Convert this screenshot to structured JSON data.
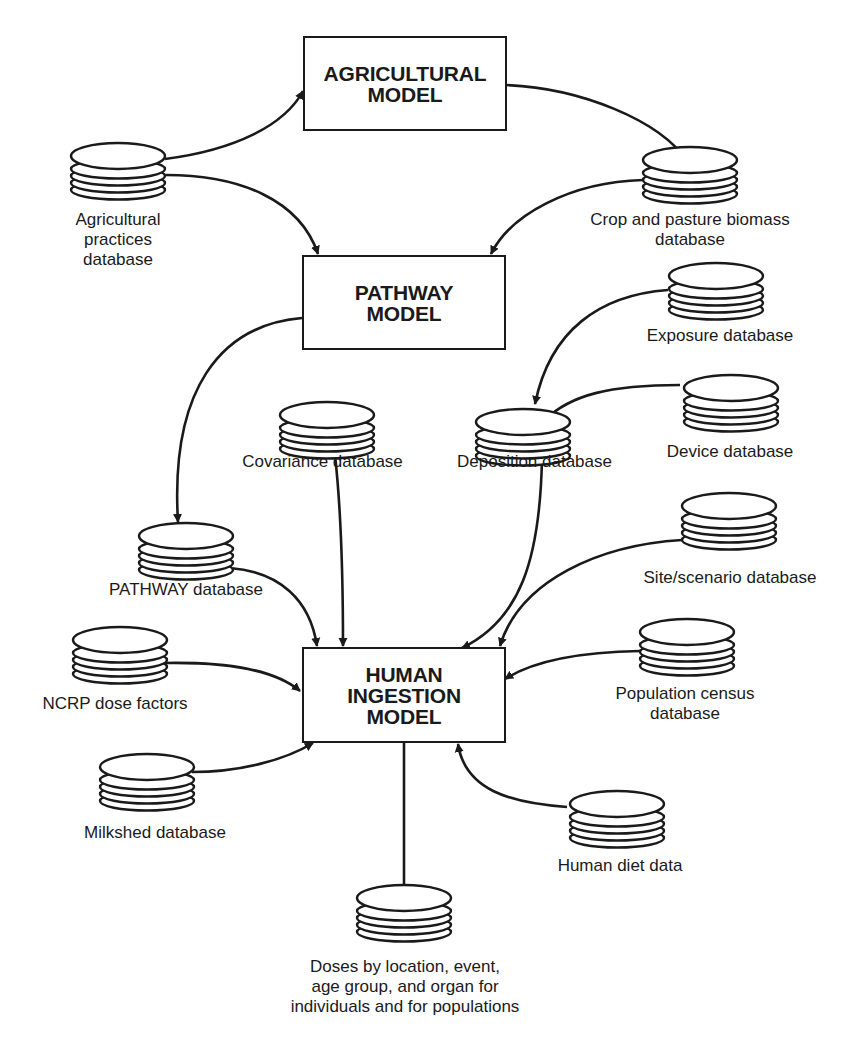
{
  "diagram": {
    "models": {
      "agricultural": {
        "title": "AGRICULTURAL\nMODEL"
      },
      "pathway": {
        "title": "PATHWAY\nMODEL"
      },
      "human_ingestion": {
        "title": "HUMAN\nINGESTION\nMODEL"
      }
    },
    "databases": {
      "agricultural_practices": {
        "label": "Agricultural\npractices\ndatabase",
        "icon": "database-icon"
      },
      "crop_pasture_biomass": {
        "label": "Crop and pasture biomass\ndatabase",
        "icon": "database-icon"
      },
      "exposure": {
        "label": "Exposure database",
        "icon": "database-icon"
      },
      "device": {
        "label": "Device database",
        "icon": "database-icon"
      },
      "covariance": {
        "label": "Covariance  database",
        "icon": "database-icon"
      },
      "deposition": {
        "label": "Deposition  database",
        "icon": "database-icon"
      },
      "pathway_db": {
        "label": "PATHWAY database",
        "icon": "database-icon"
      },
      "site_scenario": {
        "label": "Site/scenario database",
        "icon": "database-icon"
      },
      "ncrp_dose_factors": {
        "label": "NCRP dose factors",
        "icon": "database-icon"
      },
      "population_census": {
        "label": "Population census\ndatabase",
        "icon": "database-icon"
      },
      "milkshed": {
        "label": "Milkshed database",
        "icon": "database-icon"
      },
      "human_diet": {
        "label": "Human diet data",
        "icon": "database-icon"
      },
      "doses_output": {
        "label": "Doses by location, event,\nage group, and organ for\nindividuals and for populations",
        "icon": "database-icon"
      }
    },
    "edges": [
      {
        "from": "Agricultural practices database",
        "to": "AGRICULTURAL MODEL"
      },
      {
        "from": "Agricultural practices database",
        "to": "PATHWAY MODEL"
      },
      {
        "from": "AGRICULTURAL MODEL",
        "to": "Crop and pasture biomass database"
      },
      {
        "from": "Crop and pasture biomass database",
        "to": "PATHWAY MODEL"
      },
      {
        "from": "PATHWAY MODEL",
        "to": "PATHWAY database"
      },
      {
        "from": "Exposure database",
        "to": "Deposition database"
      },
      {
        "from": "Device database",
        "to": "Deposition database"
      },
      {
        "from": "PATHWAY database",
        "to": "HUMAN INGESTION MODEL"
      },
      {
        "from": "Covariance database",
        "to": "HUMAN INGESTION MODEL"
      },
      {
        "from": "Deposition database",
        "to": "HUMAN INGESTION MODEL"
      },
      {
        "from": "Site/scenario database",
        "to": "HUMAN INGESTION MODEL"
      },
      {
        "from": "NCRP dose factors",
        "to": "HUMAN INGESTION MODEL"
      },
      {
        "from": "Population census database",
        "to": "HUMAN INGESTION MODEL"
      },
      {
        "from": "Milkshed database",
        "to": "HUMAN INGESTION MODEL"
      },
      {
        "from": "Human diet data",
        "to": "HUMAN INGESTION MODEL"
      },
      {
        "from": "HUMAN INGESTION MODEL",
        "to": "Doses by location, event, age group, and organ for individuals and for populations"
      }
    ],
    "colors": {
      "ink": "#1a1a1a",
      "background": "#ffffff"
    }
  }
}
